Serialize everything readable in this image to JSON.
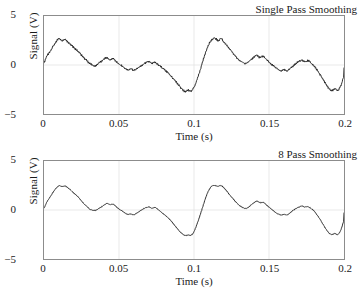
{
  "chart_data": [
    {
      "type": "line",
      "title": "Single Pass Smoothing",
      "xlabel": "Time (s)",
      "ylabel": "Signal (V)",
      "xlim": [
        0,
        0.2
      ],
      "ylim": [
        -5,
        5
      ],
      "xticks": [
        "0",
        "0.05",
        "0.1",
        "0.15",
        "0.2"
      ],
      "xtick_values": [
        0,
        0.05,
        0.1,
        0.15,
        0.2
      ],
      "yticks": [
        "5",
        "0",
        "−5"
      ],
      "ytick_values": [
        5,
        0,
        -5
      ],
      "grid": true,
      "legend": "none",
      "line_color": "#1a1a1a",
      "series": [
        {
          "name": "Signal single pass",
          "x": [
            0,
            0.002,
            0.004,
            0.006,
            0.008,
            0.01,
            0.012,
            0.014,
            0.016,
            0.018,
            0.02,
            0.022,
            0.024,
            0.026,
            0.028,
            0.03,
            0.032,
            0.034,
            0.036,
            0.038,
            0.04,
            0.042,
            0.044,
            0.046,
            0.048,
            0.05,
            0.052,
            0.054,
            0.056,
            0.058,
            0.06,
            0.062,
            0.064,
            0.066,
            0.068,
            0.07,
            0.072,
            0.074,
            0.076,
            0.078,
            0.08,
            0.082,
            0.084,
            0.086,
            0.088,
            0.09,
            0.092,
            0.094,
            0.096,
            0.098,
            0.1,
            0.102,
            0.104,
            0.106,
            0.108,
            0.11,
            0.112,
            0.114,
            0.116,
            0.118,
            0.12,
            0.122,
            0.124,
            0.126,
            0.128,
            0.13,
            0.132,
            0.134,
            0.136,
            0.138,
            0.14,
            0.142,
            0.144,
            0.146,
            0.148,
            0.15,
            0.152,
            0.154,
            0.156,
            0.158,
            0.16,
            0.162,
            0.164,
            0.166,
            0.168,
            0.17,
            0.172,
            0.174,
            0.176,
            0.178,
            0.18,
            0.182,
            0.184,
            0.186,
            0.188,
            0.19,
            0.192,
            0.194,
            0.196,
            0.198,
            0.2
          ],
          "y": [
            0.25,
            0.95,
            1.35,
            1.9,
            2.35,
            2.7,
            2.45,
            2.6,
            2.3,
            2.05,
            1.75,
            1.5,
            1.2,
            0.8,
            0.55,
            0.2,
            0.05,
            -0.1,
            0.15,
            0.35,
            0.6,
            0.75,
            0.5,
            0.65,
            0.35,
            0.1,
            -0.1,
            -0.35,
            -0.5,
            -0.4,
            -0.55,
            -0.35,
            -0.15,
            0.05,
            0.25,
            0.35,
            0.15,
            0.3,
            0.05,
            -0.2,
            -0.45,
            -0.7,
            -1.0,
            -1.35,
            -1.7,
            -2.1,
            -2.45,
            -2.7,
            -2.55,
            -2.7,
            -2.25,
            -1.5,
            -0.6,
            0.45,
            1.4,
            2.15,
            2.6,
            2.75,
            2.5,
            2.7,
            2.35,
            1.95,
            1.6,
            1.2,
            0.85,
            0.5,
            0.35,
            0.15,
            0.3,
            0.55,
            0.8,
            1.0,
            0.75,
            0.9,
            0.6,
            0.3,
            0.05,
            -0.2,
            -0.45,
            -0.6,
            -0.45,
            -0.6,
            -0.35,
            -0.1,
            0.15,
            0.35,
            0.5,
            0.3,
            0.45,
            0.2,
            -0.1,
            -0.5,
            -0.95,
            -1.45,
            -1.95,
            -2.4,
            -2.6,
            -2.4,
            -2.6,
            -2.05,
            -1.1,
            -0.3
          ]
        }
      ]
    },
    {
      "type": "line",
      "title": "8 Pass Smoothing",
      "xlabel": "Time (s)",
      "ylabel": "Signal (V)",
      "xlim": [
        0,
        0.2
      ],
      "ylim": [
        -5,
        5
      ],
      "xticks": [
        "0",
        "0.05",
        "0.1",
        "0.15",
        "0.2"
      ],
      "xtick_values": [
        0,
        0.05,
        0.1,
        0.15,
        0.2
      ],
      "yticks": [
        "5",
        "0",
        "−5"
      ],
      "ytick_values": [
        5,
        0,
        -5
      ],
      "grid": true,
      "legend": "none",
      "line_color": "#1a1a1a",
      "series": [
        {
          "name": "Signal 8 pass",
          "x": [
            0,
            0.002,
            0.004,
            0.006,
            0.008,
            0.01,
            0.012,
            0.014,
            0.016,
            0.018,
            0.02,
            0.022,
            0.024,
            0.026,
            0.028,
            0.03,
            0.032,
            0.034,
            0.036,
            0.038,
            0.04,
            0.042,
            0.044,
            0.046,
            0.048,
            0.05,
            0.052,
            0.054,
            0.056,
            0.058,
            0.06,
            0.062,
            0.064,
            0.066,
            0.068,
            0.07,
            0.072,
            0.074,
            0.076,
            0.078,
            0.08,
            0.082,
            0.084,
            0.086,
            0.088,
            0.09,
            0.092,
            0.094,
            0.096,
            0.098,
            0.1,
            0.102,
            0.104,
            0.106,
            0.108,
            0.11,
            0.112,
            0.114,
            0.116,
            0.118,
            0.12,
            0.122,
            0.124,
            0.126,
            0.128,
            0.13,
            0.132,
            0.134,
            0.136,
            0.138,
            0.14,
            0.142,
            0.144,
            0.146,
            0.148,
            0.15,
            0.152,
            0.154,
            0.156,
            0.158,
            0.16,
            0.162,
            0.164,
            0.166,
            0.168,
            0.17,
            0.172,
            0.174,
            0.176,
            0.178,
            0.18,
            0.182,
            0.184,
            0.186,
            0.188,
            0.19,
            0.192,
            0.194,
            0.196,
            0.198,
            0.2
          ],
          "y": [
            0.2,
            0.85,
            1.3,
            1.8,
            2.2,
            2.45,
            2.4,
            2.45,
            2.25,
            2.0,
            1.7,
            1.45,
            1.1,
            0.75,
            0.45,
            0.15,
            0.0,
            -0.05,
            0.1,
            0.3,
            0.5,
            0.65,
            0.55,
            0.6,
            0.35,
            0.1,
            -0.1,
            -0.3,
            -0.45,
            -0.4,
            -0.5,
            -0.3,
            -0.1,
            0.1,
            0.25,
            0.3,
            0.2,
            0.25,
            0.05,
            -0.2,
            -0.45,
            -0.7,
            -1.0,
            -1.35,
            -1.75,
            -2.1,
            -2.4,
            -2.6,
            -2.55,
            -2.6,
            -2.2,
            -1.45,
            -0.55,
            0.4,
            1.35,
            2.05,
            2.45,
            2.5,
            2.4,
            2.5,
            2.25,
            1.9,
            1.5,
            1.15,
            0.8,
            0.5,
            0.3,
            0.15,
            0.25,
            0.5,
            0.75,
            0.9,
            0.75,
            0.8,
            0.55,
            0.3,
            0.05,
            -0.2,
            -0.4,
            -0.5,
            -0.45,
            -0.5,
            -0.3,
            -0.05,
            0.15,
            0.3,
            0.4,
            0.3,
            0.35,
            0.15,
            -0.1,
            -0.5,
            -0.95,
            -1.45,
            -1.95,
            -2.35,
            -2.5,
            -2.4,
            -2.5,
            -2.0,
            -1.05,
            -0.3
          ]
        }
      ]
    }
  ]
}
